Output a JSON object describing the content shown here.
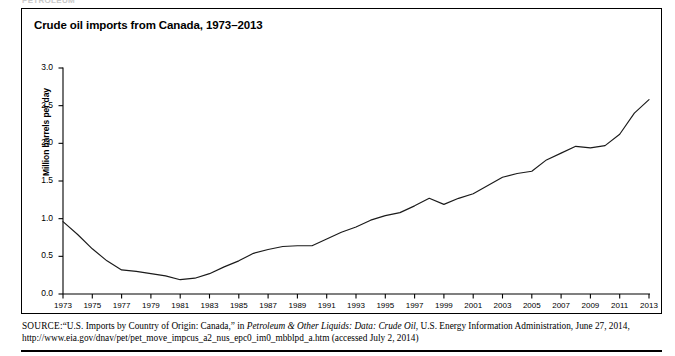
{
  "running_head": "PETROLEUM",
  "figure": {
    "title": "Crude oil imports from Canada, 1973–2013"
  },
  "source": {
    "label": "SOURCE:",
    "text_1": "“U.S. Imports by Country of Origin: Canada,” in ",
    "italic_1": "Petroleum & Other Liquids: Data: Crude Oil",
    "text_2": ", U.S. Energy Information Administration, June 27, 2014, http://www.eia.gov/dnav/pet/pet_move_impcus_a2_nus_epc0_im0_mbblpd_a.htm (accessed July 2, 2014)"
  },
  "chart_data": {
    "type": "line",
    "title": "Crude oil imports from Canada, 1973–2013",
    "xlabel": "",
    "ylabel": "Million barrels per day",
    "xlim": [
      1973,
      2013
    ],
    "ylim": [
      0.0,
      3.0
    ],
    "ytick_step": 0.5,
    "xtick_step": 2,
    "grid": false,
    "legend": "none",
    "yticks": [
      "0.0",
      "0.5",
      "1.0",
      "1.5",
      "2.0",
      "2.5",
      "3.0"
    ],
    "xticks": [
      "1973",
      "1975",
      "1977",
      "1979",
      "1981",
      "1983",
      "1985",
      "1987",
      "1989",
      "1991",
      "1993",
      "1995",
      "1997",
      "1999",
      "2001",
      "2003",
      "2005",
      "2007",
      "2009",
      "2011",
      "2013"
    ],
    "x": [
      1973,
      1974,
      1975,
      1976,
      1977,
      1978,
      1979,
      1980,
      1981,
      1982,
      1983,
      1984,
      1985,
      1986,
      1987,
      1988,
      1989,
      1990,
      1991,
      1992,
      1993,
      1994,
      1995,
      1996,
      1997,
      1998,
      1999,
      2000,
      2001,
      2002,
      2003,
      2004,
      2005,
      2006,
      2007,
      2008,
      2009,
      2010,
      2011,
      2012,
      2013
    ],
    "values": [
      0.96,
      0.79,
      0.6,
      0.44,
      0.32,
      0.3,
      0.27,
      0.24,
      0.19,
      0.21,
      0.27,
      0.36,
      0.44,
      0.54,
      0.59,
      0.63,
      0.64,
      0.64,
      0.73,
      0.82,
      0.89,
      0.98,
      1.04,
      1.08,
      1.17,
      1.27,
      1.19,
      1.27,
      1.33,
      1.44,
      1.55,
      1.6,
      1.63,
      1.78,
      1.87,
      1.96,
      1.94,
      1.97,
      2.12,
      2.4,
      2.58
    ],
    "series": [
      {
        "name": "Crude oil imports from Canada",
        "color": "#1a1a1a",
        "values": [
          0.96,
          0.79,
          0.6,
          0.44,
          0.32,
          0.3,
          0.27,
          0.24,
          0.19,
          0.21,
          0.27,
          0.36,
          0.44,
          0.54,
          0.59,
          0.63,
          0.64,
          0.64,
          0.73,
          0.82,
          0.89,
          0.98,
          1.04,
          1.08,
          1.17,
          1.27,
          1.19,
          1.27,
          1.33,
          1.44,
          1.55,
          1.6,
          1.63,
          1.78,
          1.87,
          1.96,
          1.94,
          1.97,
          2.12,
          2.4,
          2.58
        ]
      }
    ],
    "units": "Million barrels per day"
  }
}
